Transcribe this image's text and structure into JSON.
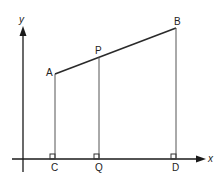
{
  "diagram": {
    "axes": {
      "x_label": "x",
      "y_label": "y"
    },
    "points": {
      "A": "A",
      "B": "B",
      "P": "P",
      "C": "C",
      "Q": "Q",
      "D": "D"
    },
    "segments": [
      {
        "from": "A",
        "to": "B",
        "kind": "line-segment"
      },
      {
        "from": "A",
        "to": "C",
        "kind": "perpendicular"
      },
      {
        "from": "P",
        "to": "Q",
        "kind": "perpendicular"
      },
      {
        "from": "B",
        "to": "D",
        "kind": "perpendicular"
      }
    ],
    "right_angles_at": [
      "C",
      "Q",
      "D"
    ]
  }
}
